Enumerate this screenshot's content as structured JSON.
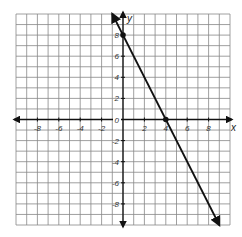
{
  "chart_data": {
    "type": "line",
    "title": "",
    "xlabel": "x",
    "ylabel": "y",
    "xlim": [
      -10,
      10
    ],
    "ylim": [
      -10,
      10
    ],
    "grid": true,
    "x_ticks": [
      "-8",
      "-6",
      "-4",
      "-2",
      "2",
      "4",
      "6",
      "8"
    ],
    "y_ticks": [
      "8",
      "6",
      "4",
      "2",
      "-2",
      "-4",
      "-6",
      "-8"
    ],
    "origin_label": "0",
    "series": [
      {
        "name": "line",
        "equation": "y = -2x + 8",
        "x": [
          -1,
          9
        ],
        "y": [
          10,
          -10
        ],
        "arrows_both_ends": true
      }
    ],
    "points": [
      {
        "x": 0,
        "y": 8
      },
      {
        "x": 4,
        "y": 0
      }
    ]
  }
}
